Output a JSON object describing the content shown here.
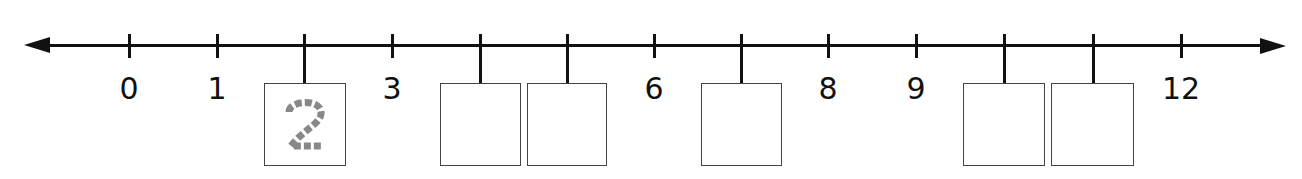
{
  "number_line": {
    "min": 0,
    "max": 12,
    "step": 1,
    "arrows": [
      "left",
      "right"
    ],
    "ticks": [
      {
        "value": 0,
        "x": 129,
        "label": "0",
        "has_box": false
      },
      {
        "value": 1,
        "x": 217,
        "label": "1",
        "has_box": false
      },
      {
        "value": 2,
        "x": 304,
        "label": "",
        "has_box": true,
        "box_hint": "2",
        "box_left": 264,
        "box_width": 82
      },
      {
        "value": 3,
        "x": 392,
        "label": "3",
        "has_box": false
      },
      {
        "value": 4,
        "x": 480,
        "label": "",
        "has_box": true,
        "box_hint": "",
        "box_left": 440,
        "box_width": 81
      },
      {
        "value": 5,
        "x": 567,
        "label": "",
        "has_box": true,
        "box_hint": "",
        "box_left": 527,
        "box_width": 80
      },
      {
        "value": 6,
        "x": 654,
        "label": "6",
        "has_box": false
      },
      {
        "value": 7,
        "x": 741,
        "label": "",
        "has_box": true,
        "box_hint": "",
        "box_left": 701,
        "box_width": 81
      },
      {
        "value": 8,
        "x": 828,
        "label": "8",
        "has_box": false
      },
      {
        "value": 9,
        "x": 916,
        "label": "9",
        "has_box": false
      },
      {
        "value": 10,
        "x": 1004,
        "label": "",
        "has_box": true,
        "box_hint": "",
        "box_left": 963,
        "box_width": 82
      },
      {
        "value": 11,
        "x": 1093,
        "label": "",
        "has_box": true,
        "box_hint": "",
        "box_left": 1051,
        "box_width": 83
      },
      {
        "value": 12,
        "x": 1181,
        "label": "12",
        "has_box": false
      }
    ],
    "hint_box": {
      "text": "2",
      "style": "dashed-trace",
      "color": "#888888"
    }
  },
  "colors": {
    "line": "#111111",
    "box_border": "#444444",
    "hint": "#888888",
    "background": "#ffffff"
  }
}
